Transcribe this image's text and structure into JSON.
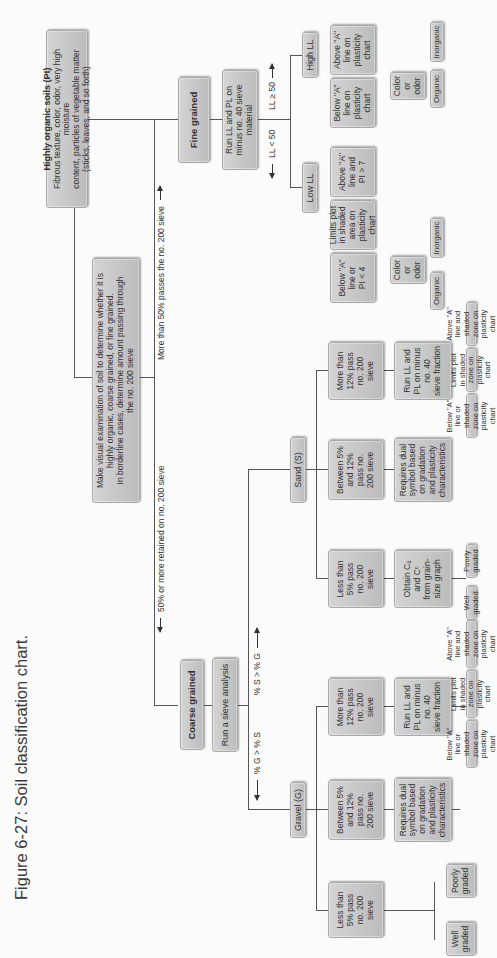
{
  "caption": "Figure 6-27: Soil classification chart.",
  "root": "Make visual examination of soil to determine whether it is\nhighly organic, coarse grained, or fine grained.\nIn borderline cases, determine amount passing through\nthe no. 200 sieve",
  "organic": {
    "title": "Highly organic soils (Pt)",
    "body": "Fibrous texture, color, odor, very high moisture\ncontent, particles of vegetable matter\n(sticks, leaves, and so forth)"
  },
  "branch_labels": {
    "coarse": "50% or more retained on no. 200 sieve",
    "fine": "More than 50% passes the no. 200 sieve",
    "gravel_cond": "% G > % S",
    "sand_cond": "% S > % G",
    "low_ll_cond": "LL < 50",
    "high_ll_cond": "LL ≥ 50"
  },
  "coarse": {
    "title": "Coarse grained",
    "step": "Run a sieve analysis",
    "gravel": {
      "title": "Gravel (G)",
      "less5": "Less than\n5% pass\nno. 200\nsieve",
      "between": "Between 5%\nand 12%\npass no.\n200 sieve",
      "more12": "More than\n12% pass\nno. 200\nsieve",
      "dual": "Requires dual\nsymbol based\non gradation\nand plasticity\ncharacteristics",
      "run_ll": "Run LL and\nPL on minus\nno. 40\nsieve fraction",
      "well": "Well\ngraded",
      "poorly": "Poorly\ngraded",
      "below_a": "Below \"A\"\nline or\nshaded\nzone on\nplasticity\nchart",
      "limits": "Limits plot\nin shaded\nzone on\nplasticity\nchart",
      "above_a": "Above \"A\"\nline and\nshaded\nzone on\nplasticity\nchart",
      "results": {
        "gw": "GW",
        "gp": "GP",
        "dual": "GW-GM\nGP-GM\nGW-GC\nGP-GC",
        "gm": "GM",
        "gmgc": "GM-GC",
        "gc": "GC"
      }
    },
    "sand": {
      "title": "Sand (S)",
      "less5": "Less than\n5% pass\nno. 200\nsieve",
      "between": "Between 5%\nand 12%\npass no.\n200 sieve",
      "more12": "More than\n12% pass\nno. 200\nsieve",
      "obtain": "Obtain Cᵤ\nand Cᶜ\nfrom grain-\nsize graph",
      "dual": "Requires dual\nsymbol based\non gradation\nand plasticity\ncharacteristics",
      "run_ll": "Run LL and\nPL on minus\nno. 40\nsieve fraction",
      "well": "Well\ngraded",
      "poorly": "Poorly\ngraded",
      "below_a": "Below \"A\"\nline or\nshaded\nzone on\nplasticity\nchart",
      "limits": "Limits plot\nin shaded\nzone on\nplasticity\nchart",
      "above_a": "Above \"A\"\nline and\nshaded\nzone on\nplasticity\nchart",
      "results": {
        "sw": "SW",
        "sp": "SP",
        "dual": "SW-SM\nSP-SM\nSW-SC\nSP-SC",
        "sm": "SM",
        "smsc": "SM-SC",
        "sc": "SC"
      }
    }
  },
  "fine": {
    "title": "Fine grained",
    "step": "Run LL and PL on\nminus no. 40 sieve material",
    "low": {
      "title": "Low LL",
      "below_a": "Below \"A\"\nline or\nPI < 4",
      "limits": "Limits plot\nin shaded\narea on\nplasticity\nchart",
      "above_a": "Above \"A\"\nline and\nPI > 7",
      "color": "Color\nor\nodor",
      "organic": "Organic",
      "inorganic": "Inorganic",
      "results": {
        "ol": "OL",
        "ml": "ML",
        "mlcl": "ML-CL",
        "cl": "CL"
      }
    },
    "high": {
      "title": "High LL",
      "below_a": "Below \"A\"\nline on\nplasticity\nchart",
      "above_a": "Above \"A\"\nline on\nplasticity\nchart",
      "color": "Color\nor\nodor",
      "organic": "Organic",
      "inorganic": "Inorganic",
      "results": {
        "oh": "OH",
        "mh": "MH",
        "ch": "CH"
      }
    }
  }
}
